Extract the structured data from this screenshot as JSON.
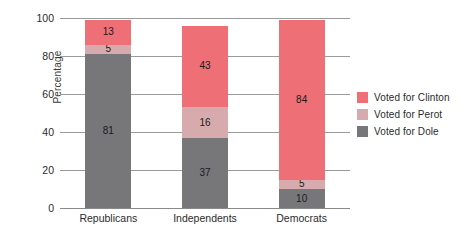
{
  "chart_data": {
    "type": "bar",
    "subtype": "stacked-vertical",
    "title": "",
    "xlabel": "",
    "ylabel": "Percentage",
    "ylim": [
      0,
      100
    ],
    "yticks": [
      0,
      20,
      40,
      60,
      80,
      100
    ],
    "grid": true,
    "legend_position": "right",
    "categories": [
      "Republicans",
      "Independents",
      "Democrats"
    ],
    "series": [
      {
        "name": "Voted for Dole",
        "color": "#77777a",
        "values": [
          81,
          37,
          10
        ]
      },
      {
        "name": "Voted for Perot",
        "color": "#d7abae",
        "values": [
          5,
          16,
          5
        ]
      },
      {
        "name": "Voted for Clinton",
        "color": "#ef6f76",
        "values": [
          13,
          43,
          84
        ]
      }
    ],
    "totals": [
      99,
      96,
      99
    ],
    "bars": [
      {
        "category": "Republicans",
        "segments": [
          {
            "series": "Voted for Dole",
            "value": 81,
            "label": "81",
            "color": "#77777a"
          },
          {
            "series": "Voted for Perot",
            "value": 5,
            "label": "5",
            "color": "#d7abae"
          },
          {
            "series": "Voted for Clinton",
            "value": 13,
            "label": "13",
            "color": "#ef6f76"
          }
        ]
      },
      {
        "category": "Independents",
        "segments": [
          {
            "series": "Voted for Dole",
            "value": 37,
            "label": "37",
            "color": "#77777a"
          },
          {
            "series": "Voted for Perot",
            "value": 16,
            "label": "16",
            "color": "#d7abae"
          },
          {
            "series": "Voted for Clinton",
            "value": 43,
            "label": "43",
            "color": "#ef6f76"
          }
        ]
      },
      {
        "category": "Democrats",
        "segments": [
          {
            "series": "Voted for Dole",
            "value": 10,
            "label": "10",
            "color": "#77777a"
          },
          {
            "series": "Voted for Perot",
            "value": 5,
            "label": "5",
            "color": "#d7abae"
          },
          {
            "series": "Voted for Clinton",
            "value": 84,
            "label": "84",
            "color": "#ef6f76"
          }
        ]
      }
    ]
  },
  "axes": {
    "y_title": "Percentage",
    "y_tick_labels": [
      "0",
      "20",
      "40",
      "60",
      "80",
      "100"
    ],
    "x_tick_labels": [
      "Republicans",
      "Independents",
      "Democrats"
    ]
  },
  "legend": {
    "items": [
      {
        "label": "Voted for Clinton",
        "color": "#ef6f76",
        "swatch": "legend-swatch-clinton"
      },
      {
        "label": "Voted for Perot",
        "color": "#d7abae",
        "swatch": "legend-swatch-perot"
      },
      {
        "label": "Voted for Dole",
        "color": "#77777a",
        "swatch": "legend-swatch-dole"
      }
    ]
  },
  "colors": {
    "clinton": "#ef6f76",
    "perot": "#d7abae",
    "dole": "#77777a",
    "gridline": "#9b9b9b",
    "text": "#2b2b2b",
    "background": "#ffffff"
  }
}
